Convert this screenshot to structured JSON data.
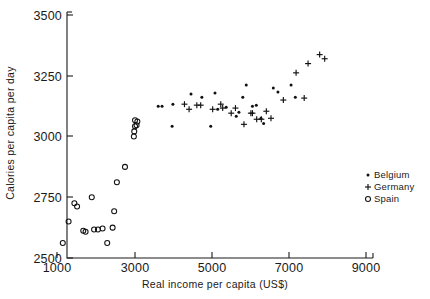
{
  "chart_data": {
    "type": "scatter",
    "title": "",
    "xlabel": "Real income per capita (US$)",
    "ylabel": "Calories per capita per day",
    "xlim": [
      800,
      9500
    ],
    "ylim": [
      2500,
      3500
    ],
    "xticks": [
      1000,
      3000,
      5000,
      7000,
      9000
    ],
    "yticks": [
      2500,
      2750,
      3000,
      3250,
      3500
    ],
    "xtick_labels": [
      "1000",
      "3000",
      "5000",
      "7000",
      "9000"
    ],
    "ytick_labels": [
      "2500",
      "2750",
      "3000",
      "3250",
      "3500"
    ],
    "grid": false,
    "legend_position": "right-middle",
    "series": [
      {
        "name": "Belgium",
        "marker": "dot",
        "color": "#111111",
        "points": [
          [
            3620,
            3125
          ],
          [
            3720,
            3125
          ],
          [
            4000,
            3133
          ],
          [
            4470,
            3175
          ],
          [
            4750,
            3162
          ],
          [
            5090,
            3179
          ],
          [
            5160,
            3112
          ],
          [
            5380,
            3120
          ],
          [
            5640,
            3083
          ],
          [
            5710,
            3100
          ],
          [
            5810,
            3162
          ],
          [
            5900,
            3212
          ],
          [
            6060,
            3125
          ],
          [
            6160,
            3129
          ],
          [
            6280,
            3075
          ],
          [
            6350,
            3054
          ],
          [
            6600,
            3200
          ],
          [
            6720,
            3183
          ],
          [
            7060,
            3212
          ],
          [
            7170,
            3162
          ],
          [
            3980,
            3042
          ],
          [
            4980,
            3042
          ]
        ]
      },
      {
        "name": "Germany",
        "marker": "plus",
        "color": "#111111",
        "points": [
          [
            4300,
            3133
          ],
          [
            4420,
            3112
          ],
          [
            4620,
            3129
          ],
          [
            4720,
            3129
          ],
          [
            5030,
            3112
          ],
          [
            5240,
            3133
          ],
          [
            5290,
            3117
          ],
          [
            5620,
            3117
          ],
          [
            5510,
            3096
          ],
          [
            6020,
            3096
          ],
          [
            6060,
            3096
          ],
          [
            6170,
            3071
          ],
          [
            6290,
            3071
          ],
          [
            6420,
            3104
          ],
          [
            6540,
            3075
          ],
          [
            5840,
            3050
          ],
          [
            7190,
            3262
          ],
          [
            7500,
            3300
          ],
          [
            7800,
            3337
          ],
          [
            7930,
            3320
          ],
          [
            6860,
            3150
          ],
          [
            7400,
            3158
          ]
        ]
      },
      {
        "name": "Spain",
        "marker": "circle",
        "color": "#111111",
        "points": [
          [
            1150,
            2562
          ],
          [
            1300,
            2650
          ],
          [
            1450,
            2725
          ],
          [
            1520,
            2712
          ],
          [
            1680,
            2612
          ],
          [
            1740,
            2608
          ],
          [
            1900,
            2750
          ],
          [
            1960,
            2617
          ],
          [
            2060,
            2617
          ],
          [
            2180,
            2621
          ],
          [
            2300,
            2562
          ],
          [
            2480,
            2692
          ],
          [
            2440,
            2625
          ],
          [
            2550,
            2812
          ],
          [
            2760,
            2875
          ],
          [
            2990,
            3000
          ],
          [
            3020,
            3042
          ],
          [
            3060,
            3046
          ],
          [
            3020,
            3067
          ],
          [
            3080,
            3062
          ],
          [
            3000,
            3021
          ]
        ]
      }
    ]
  },
  "legend": {
    "items": [
      {
        "label": "Belgium",
        "marker": "dot"
      },
      {
        "label": "Germany",
        "marker": "plus"
      },
      {
        "label": "Spain",
        "marker": "circle"
      }
    ]
  }
}
